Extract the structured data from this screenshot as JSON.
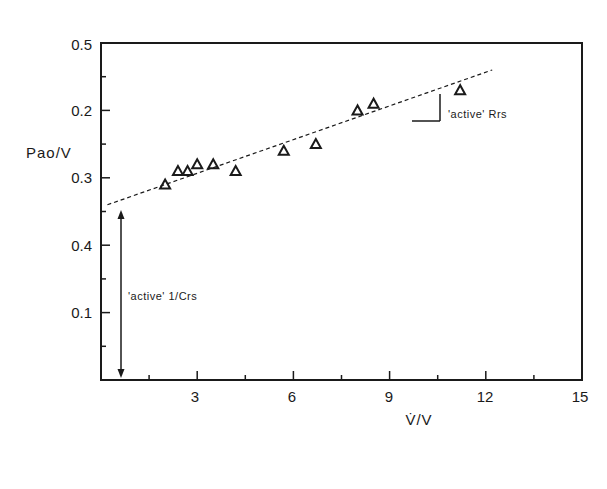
{
  "chart_data": {
    "type": "scatter",
    "title": "",
    "xlabel": "V̇/V",
    "ylabel": "Pao/V",
    "xlim": [
      0,
      15
    ],
    "ylim": [
      0,
      0.5
    ],
    "x_ticks": [
      3,
      6,
      9,
      12,
      15
    ],
    "x_tick_labels": [
      "3",
      "6",
      "9",
      "12",
      "15"
    ],
    "x_minor_ticks": [
      1.5,
      4.5,
      7.5,
      10.5,
      13.5
    ],
    "y_ticks": [
      0.1,
      0.2,
      0.3,
      0.4,
      0.5
    ],
    "y_tick_labels": [
      "0.1",
      "0.2",
      "0.3",
      "0.4",
      "0.5"
    ],
    "y_minor_ticks": [
      0.05,
      0.15,
      0.25,
      0.35,
      0.45
    ],
    "grid": false,
    "legend": null,
    "marker": "triangle-open",
    "series": [
      {
        "name": "data",
        "points": [
          {
            "x": 2.0,
            "y": 0.29
          },
          {
            "x": 2.4,
            "y": 0.31
          },
          {
            "x": 2.7,
            "y": 0.31
          },
          {
            "x": 3.0,
            "y": 0.32
          },
          {
            "x": 3.5,
            "y": 0.32
          },
          {
            "x": 4.2,
            "y": 0.31
          },
          {
            "x": 5.7,
            "y": 0.34
          },
          {
            "x": 6.7,
            "y": 0.35
          },
          {
            "x": 8.0,
            "y": 0.4
          },
          {
            "x": 8.5,
            "y": 0.41
          },
          {
            "x": 11.2,
            "y": 0.43
          }
        ]
      }
    ],
    "fit_line": {
      "style": "dashed",
      "x": [
        0.2,
        12.2
      ],
      "y": [
        0.26,
        0.46
      ]
    },
    "annotations": [
      {
        "text": "'active' Rrs",
        "note": "slope of fitted line"
      },
      {
        "text": "'active' 1/Crs",
        "note": "intercept arrow from 0 to line intercept"
      }
    ]
  },
  "labels": {
    "xlabel": "V̇/V",
    "ylabel": "Pao/V",
    "rrs": "'active' Rrs",
    "crs": "'active' 1/Crs",
    "x_ticks": [
      "3",
      "6",
      "9",
      "12",
      "15"
    ],
    "y_ticks": [
      "0.1",
      "0.2",
      "0.3",
      "0.4",
      "0.5"
    ]
  }
}
